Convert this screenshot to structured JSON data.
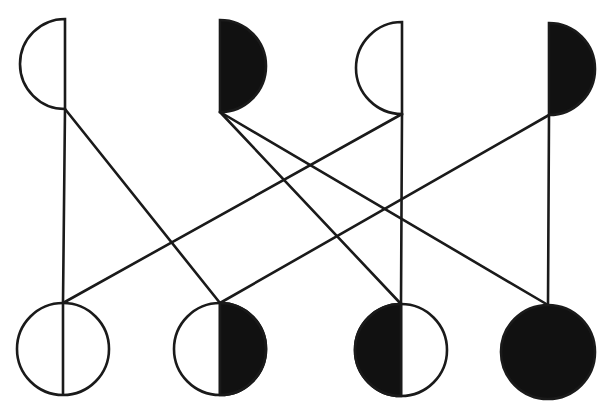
{
  "diagram": {
    "type": "bipartite-cross-diagram",
    "stroke_color": "#1a1a1a",
    "fill_color": "#111111",
    "background": "#ffffff",
    "top_nodes": [
      {
        "id": "T1",
        "shape": "left-half-circle",
        "fill": "open",
        "cx": 65,
        "cy": 64,
        "r": 45
      },
      {
        "id": "T2",
        "shape": "right-half-circle",
        "fill": "filled",
        "cx": 220,
        "cy": 66,
        "r": 46
      },
      {
        "id": "T3",
        "shape": "left-half-circle",
        "fill": "open",
        "cx": 402,
        "cy": 68,
        "r": 46
      },
      {
        "id": "T4",
        "shape": "right-half-circle",
        "fill": "filled",
        "cx": 549,
        "cy": 69,
        "r": 46
      }
    ],
    "bottom_nodes": [
      {
        "id": "B1",
        "shape": "circle",
        "fill": "open-with-divider",
        "cx": 63,
        "cy": 349,
        "r": 46
      },
      {
        "id": "B2",
        "shape": "circle",
        "fill": "right-half-filled",
        "cx": 220,
        "cy": 349,
        "r": 46
      },
      {
        "id": "B3",
        "shape": "circle",
        "fill": "left-half-filled",
        "cx": 401,
        "cy": 350,
        "r": 46
      },
      {
        "id": "B4",
        "shape": "circle",
        "fill": "filled",
        "cx": 548,
        "cy": 352,
        "r": 47
      }
    ],
    "edges": [
      {
        "from": "T1",
        "to": "B1"
      },
      {
        "from": "T1",
        "to": "B2"
      },
      {
        "from": "T2",
        "to": "B3"
      },
      {
        "from": "T2",
        "to": "B4"
      },
      {
        "from": "T3",
        "to": "B1"
      },
      {
        "from": "T3",
        "to": "B3"
      },
      {
        "from": "T4",
        "to": "B2"
      },
      {
        "from": "T4",
        "to": "B4"
      }
    ]
  }
}
